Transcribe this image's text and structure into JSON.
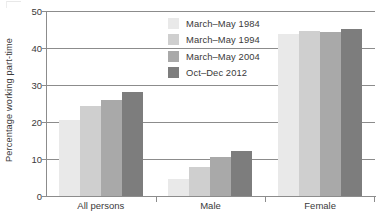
{
  "chart_data": {
    "type": "bar",
    "title": "",
    "subtitle": "",
    "xlabel": "",
    "ylabel": "Percentage working part-time",
    "categories": [
      "All persons",
      "Male",
      "Female"
    ],
    "series": [
      {
        "name": "March–May 1984",
        "color": "#e9e9e9",
        "values": [
          20.5,
          4.5,
          43.8
        ]
      },
      {
        "name": "March–May 1994",
        "color": "#cfcfcf",
        "values": [
          24.3,
          7.8,
          44.6
        ]
      },
      {
        "name": "March–May 2004",
        "color": "#a9a9a9",
        "values": [
          26.0,
          10.6,
          44.2
        ]
      },
      {
        "name": "Oct–Dec 2012",
        "color": "#7d7d7d",
        "values": [
          28.0,
          12.1,
          45.1
        ]
      }
    ],
    "ylim": [
      0,
      50
    ],
    "yticks": [
      0,
      10,
      20,
      30,
      40,
      50
    ],
    "ytick_labels": [
      "0",
      "10",
      "20",
      "30",
      "40",
      "50"
    ],
    "grid": true,
    "grid_axis": "y",
    "legend_position": "top-center-left",
    "axis_color": "#8c8c8c",
    "text_color": "#3a3a3a",
    "background": "#ffffff"
  },
  "legend": {
    "entries": [
      {
        "label": "March–May 1984",
        "swatch_name": "legend-swatch-march-may-1984"
      },
      {
        "label": "March–May 1994",
        "swatch_name": "legend-swatch-march-may-1994"
      },
      {
        "label": "March–May 2004",
        "swatch_name": "legend-swatch-march-may-2004"
      },
      {
        "label": "Oct–Dec 2012",
        "swatch_name": "legend-swatch-oct-dec-2012"
      }
    ]
  },
  "axes": {
    "y_axis_title": "Percentage working part-time",
    "y_tick_labels": [
      "50",
      "40",
      "30",
      "20",
      "10",
      "0"
    ],
    "x_tick_labels": [
      "All persons",
      "Male",
      "Female"
    ]
  }
}
